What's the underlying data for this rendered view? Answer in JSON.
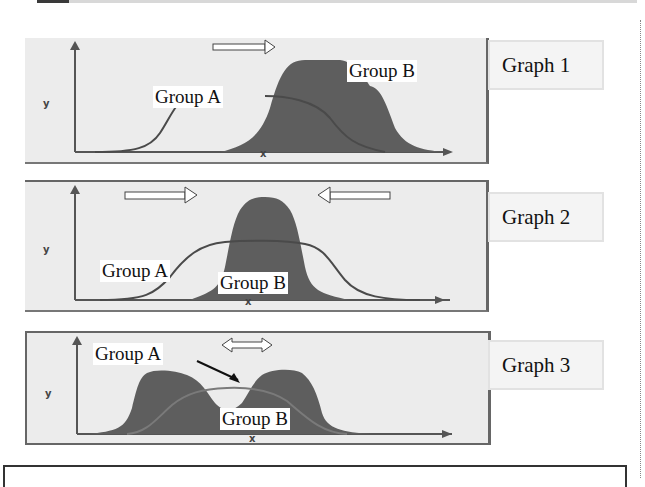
{
  "graphs": [
    {
      "label": "Graph 1",
      "group_a": "Group A",
      "group_b": "Group B",
      "axis_y": "y",
      "axis_x": "x",
      "arrows": [
        "right"
      ]
    },
    {
      "label": "Graph 2",
      "group_a": "Group A",
      "group_b": "Group B",
      "axis_y": "y",
      "axis_x": "x",
      "arrows": [
        "right",
        "left"
      ]
    },
    {
      "label": "Graph 3",
      "group_a": "Group A",
      "group_b": "Group B",
      "axis_y": "y",
      "axis_x": "x",
      "arrows": [
        "both"
      ]
    }
  ],
  "colors": {
    "panel_bg": "#ececec",
    "group_b_fill": "#5e5e5e",
    "group_a_line": "#4a4a4a",
    "frame": "#666666"
  }
}
